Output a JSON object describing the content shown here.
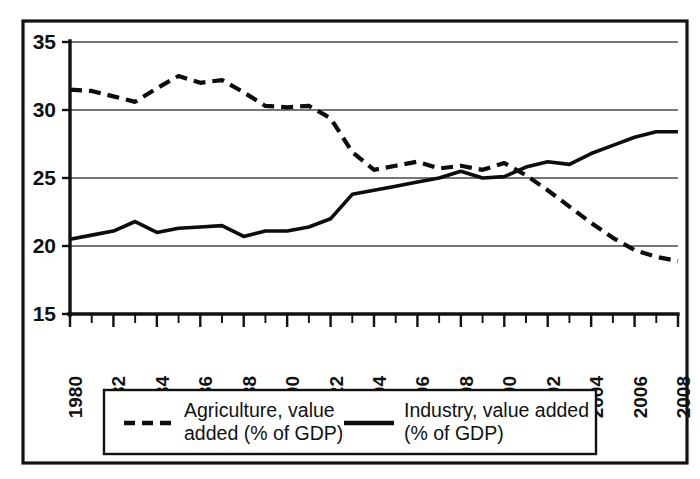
{
  "chart_data": {
    "type": "line",
    "title": "",
    "subtitle": "",
    "xlabel": "",
    "ylabel": "",
    "xlim": [
      1980,
      2008
    ],
    "ylim": [
      15,
      35
    ],
    "grid": true,
    "legend_position": "bottom",
    "y_ticks": [
      15,
      20,
      25,
      30,
      35
    ],
    "y_tick_labels": [
      "15",
      "20",
      "25",
      "30",
      "35"
    ],
    "x_ticks": [
      1980,
      1982,
      1984,
      1986,
      1988,
      1990,
      1992,
      1994,
      1996,
      1998,
      2000,
      2002,
      2004,
      2006,
      2008
    ],
    "x_tick_labels": [
      "1980",
      "1982",
      "1984",
      "1986",
      "1988",
      "1990",
      "1922",
      "1994",
      "1996",
      "1998",
      "2000",
      "2002",
      "2004",
      "2006",
      "2008"
    ],
    "x": [
      1980,
      1981,
      1982,
      1983,
      1984,
      1985,
      1986,
      1987,
      1988,
      1989,
      1990,
      1991,
      1992,
      1993,
      1994,
      1995,
      1996,
      1997,
      1998,
      1999,
      2000,
      2001,
      2002,
      2003,
      2004,
      2005,
      2006,
      2007,
      2008
    ],
    "series": [
      {
        "name": "Agriculture, value added (% of GDP)",
        "style": "dashed",
        "color": "#0d0d0d",
        "values": [
          31.5,
          31.4,
          31.0,
          30.6,
          31.6,
          32.5,
          32.0,
          32.2,
          31.3,
          30.3,
          30.2,
          30.3,
          29.4,
          26.9,
          25.6,
          25.9,
          26.2,
          25.7,
          25.9,
          25.6,
          26.1,
          25.2,
          24.1,
          22.9,
          21.7,
          20.6,
          19.7,
          19.2,
          18.9
        ]
      },
      {
        "name": "Industry, value added (% of GDP)",
        "style": "solid",
        "color": "#0d0d0d",
        "values": [
          20.5,
          20.8,
          21.1,
          21.8,
          21.0,
          21.3,
          21.4,
          21.5,
          20.7,
          21.1,
          21.1,
          21.4,
          22.0,
          23.8,
          24.1,
          24.4,
          24.7,
          25.0,
          25.5,
          25.0,
          25.1,
          25.8,
          26.2,
          26.0,
          26.8,
          27.4,
          28.0,
          28.4,
          28.4
        ]
      }
    ],
    "legend": [
      {
        "label": "Agriculture, value added (% of GDP)",
        "line1": "Agriculture, value",
        "line2": "added (% of GDP)",
        "style": "dashed"
      },
      {
        "label": "Industry, value added (% of GDP)",
        "line1": "Industry, value added",
        "line2": "(% of GDP)",
        "style": "solid"
      }
    ]
  },
  "colors": {
    "frame": "#111111",
    "grid": "#4a4a4a",
    "ink": "#0d0d0d",
    "background": "#ffffff"
  }
}
